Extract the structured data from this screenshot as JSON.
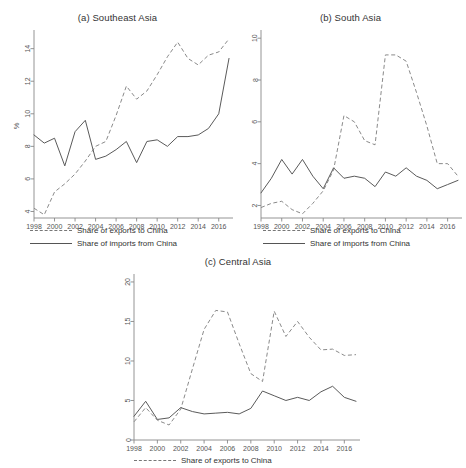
{
  "figure": {
    "background": "#ffffff",
    "series_colors": {
      "exports": "#8a8a8a",
      "imports": "#5a5a5a"
    },
    "legend": {
      "exports_label": "Share of exports to China",
      "imports_label": "Share of imports from China"
    }
  },
  "chart_data": [
    {
      "type": "line",
      "panel": "a",
      "title": "(a) Southeast Asia",
      "xlabel": "",
      "ylabel": "%",
      "xlim": [
        1998,
        2017
      ],
      "ylim": [
        3.6,
        14.9
      ],
      "xticks": [
        1998,
        2000,
        2002,
        2004,
        2006,
        2008,
        2010,
        2012,
        2014,
        2016
      ],
      "yticks": [
        4,
        6,
        8,
        10,
        12,
        14
      ],
      "grid": false,
      "legend_position": "below",
      "x": [
        1998,
        1999,
        2000,
        2001,
        2002,
        2003,
        2004,
        2005,
        2006,
        2007,
        2008,
        2009,
        2010,
        2011,
        2012,
        2013,
        2014,
        2015,
        2016,
        2017
      ],
      "series": [
        {
          "name": "Share of exports to China",
          "style": "dashed",
          "values": [
            4.2,
            3.8,
            5.2,
            5.7,
            6.3,
            7.1,
            8.0,
            8.3,
            9.9,
            11.7,
            10.9,
            11.4,
            12.4,
            13.5,
            14.4,
            13.4,
            13.0,
            13.6,
            13.8,
            14.6
          ]
        },
        {
          "name": "Share of imports from China",
          "style": "solid",
          "values": [
            8.7,
            8.2,
            8.5,
            6.8,
            8.9,
            9.6,
            7.2,
            7.4,
            7.8,
            8.3,
            7.0,
            8.3,
            8.4,
            8.0,
            8.6,
            8.6,
            8.7,
            9.1,
            10.0,
            13.4
          ]
        }
      ]
    },
    {
      "type": "line",
      "panel": "b",
      "title": "(b) South Asia",
      "xlabel": "",
      "ylabel": "",
      "xlim": [
        1998,
        2017
      ],
      "ylim": [
        1.4,
        10.2
      ],
      "xticks": [
        1998,
        2000,
        2002,
        2004,
        2006,
        2008,
        2010,
        2012,
        2014,
        2016
      ],
      "yticks": [
        2,
        4,
        6,
        8,
        10
      ],
      "grid": false,
      "legend_position": "below",
      "x": [
        1998,
        1999,
        2000,
        2001,
        2002,
        2003,
        2004,
        2005,
        2006,
        2007,
        2008,
        2009,
        2010,
        2011,
        2012,
        2013,
        2014,
        2015,
        2016,
        2017
      ],
      "series": [
        {
          "name": "Share of exports to China",
          "style": "dashed",
          "values": [
            1.9,
            2.1,
            2.2,
            1.8,
            1.6,
            2.1,
            2.7,
            3.7,
            6.3,
            6.0,
            5.1,
            4.9,
            9.2,
            9.2,
            8.9,
            7.4,
            5.8,
            4.0,
            4.0,
            3.4
          ]
        },
        {
          "name": "Share of imports from China",
          "style": "solid",
          "values": [
            2.6,
            3.3,
            4.2,
            3.5,
            4.2,
            3.4,
            2.8,
            3.8,
            3.3,
            3.4,
            3.3,
            2.9,
            3.6,
            3.4,
            3.8,
            3.4,
            3.2,
            2.8,
            3.0,
            3.2
          ]
        }
      ]
    },
    {
      "type": "line",
      "panel": "c",
      "title": "(c) Central Asia",
      "xlabel": "",
      "ylabel": "",
      "xlim": [
        1998,
        2017
      ],
      "ylim": [
        0,
        20.5
      ],
      "xticks": [
        1998,
        2000,
        2002,
        2004,
        2006,
        2008,
        2010,
        2012,
        2014,
        2016
      ],
      "yticks": [
        0,
        5,
        10,
        15,
        20
      ],
      "grid": false,
      "legend_position": "below",
      "x": [
        1998,
        1999,
        2000,
        2001,
        2002,
        2003,
        2004,
        2005,
        2006,
        2007,
        2008,
        2009,
        2010,
        2011,
        2012,
        2013,
        2014,
        2015,
        2016,
        2017
      ],
      "series": [
        {
          "name": "Share of exports to China",
          "style": "dashed",
          "values": [
            2.3,
            4.1,
            2.5,
            1.9,
            3.9,
            9.0,
            14.0,
            16.4,
            16.2,
            12.2,
            8.4,
            7.4,
            16.3,
            13.1,
            15.0,
            13.0,
            11.4,
            11.5,
            10.7,
            10.8
          ]
        },
        {
          "name": "Share of imports from China",
          "style": "solid",
          "values": [
            3.0,
            4.9,
            2.6,
            2.8,
            4.1,
            3.6,
            3.3,
            3.4,
            3.5,
            3.3,
            4.0,
            6.2,
            5.6,
            5.0,
            5.4,
            5.0,
            6.1,
            6.8,
            5.4,
            4.9
          ]
        }
      ]
    }
  ]
}
